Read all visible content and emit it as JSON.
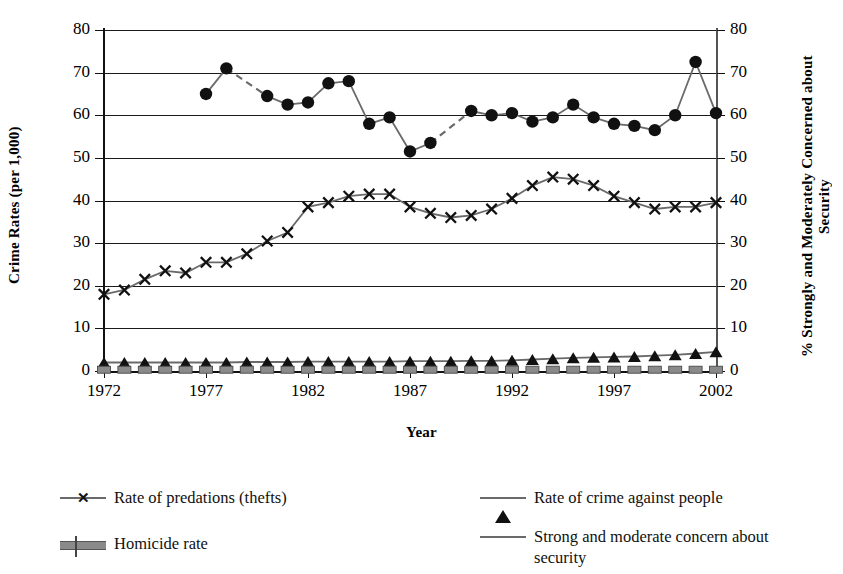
{
  "axes": {
    "y_left_title": "Crime Rates (per 1,000)",
    "y_right_title": "% Strongly and Moderately Concerned about Security",
    "x_title": "Year",
    "y_ticks": [
      0,
      10,
      20,
      30,
      40,
      50,
      60,
      70,
      80
    ],
    "x_ticks": [
      1972,
      1977,
      1982,
      1987,
      1992,
      1997,
      2002
    ]
  },
  "legend": {
    "items": [
      {
        "label": "Rate of predations (thefts)",
        "marker": "x-marker-icon",
        "color": "#6a6a6a"
      },
      {
        "label": "Rate of crime against people",
        "marker": "triangle-marker-icon",
        "color": "#6a6a6a"
      },
      {
        "label": "Homicide rate",
        "marker": "thick-bar-marker-icon",
        "color": "#8a8a8a"
      },
      {
        "label": "Strong and moderate concern about security",
        "marker": "circle-marker-icon",
        "color": "#6a6a6a"
      }
    ]
  },
  "chart_data": {
    "type": "line",
    "title": "",
    "xlabel": "Year",
    "ylabel": "Crime Rates (per 1,000)",
    "y2label": "% Strongly and Moderately Concerned about Security",
    "xlim": [
      1972,
      2002
    ],
    "ylim": [
      0,
      80
    ],
    "y2lim": [
      0,
      80
    ],
    "grid": true,
    "legend_position": "bottom",
    "x": [
      1972,
      1973,
      1974,
      1975,
      1976,
      1977,
      1978,
      1979,
      1980,
      1981,
      1982,
      1983,
      1984,
      1985,
      1986,
      1987,
      1988,
      1989,
      1990,
      1991,
      1992,
      1993,
      1994,
      1995,
      1996,
      1997,
      1998,
      1999,
      2000,
      2001,
      2002
    ],
    "series": [
      {
        "name": "Rate of predations (thefts)",
        "axis": "left",
        "marker": "x",
        "values": [
          18.0,
          19.0,
          21.5,
          23.5,
          23.0,
          25.5,
          25.5,
          27.5,
          30.5,
          32.5,
          38.5,
          39.5,
          41.0,
          41.5,
          41.5,
          38.5,
          37.0,
          36.0,
          36.5,
          38.0,
          40.5,
          43.5,
          45.5,
          45.0,
          43.5,
          41.0,
          39.5,
          38.0,
          38.5,
          38.5,
          39.5
        ]
      },
      {
        "name": "Rate of crime against people",
        "axis": "left",
        "marker": "triangle",
        "values": [
          2.0,
          2.0,
          2.0,
          2.0,
          2.0,
          2.0,
          2.0,
          2.1,
          2.1,
          2.1,
          2.2,
          2.2,
          2.2,
          2.2,
          2.2,
          2.3,
          2.3,
          2.3,
          2.4,
          2.4,
          2.5,
          2.7,
          2.9,
          3.1,
          3.2,
          3.3,
          3.4,
          3.6,
          3.8,
          4.1,
          4.5
        ]
      },
      {
        "name": "Homicide rate",
        "axis": "left",
        "marker": "bar",
        "values": [
          0.3,
          0.3,
          0.3,
          0.3,
          0.3,
          0.3,
          0.3,
          0.3,
          0.3,
          0.3,
          0.3,
          0.3,
          0.3,
          0.3,
          0.3,
          0.3,
          0.3,
          0.3,
          0.3,
          0.3,
          0.3,
          0.3,
          0.3,
          0.3,
          0.3,
          0.3,
          0.3,
          0.3,
          0.3,
          0.3,
          0.3
        ]
      },
      {
        "name": "Strong and moderate concern about security",
        "axis": "right",
        "marker": "circle",
        "values": [
          null,
          null,
          null,
          null,
          null,
          65.0,
          71.0,
          null,
          64.5,
          62.5,
          63.0,
          67.5,
          68.0,
          58.0,
          59.5,
          51.5,
          53.5,
          null,
          61.0,
          60.0,
          60.5,
          58.5,
          59.5,
          62.5,
          59.5,
          58.0,
          57.5,
          56.5,
          60.0,
          72.5,
          60.5
        ],
        "dashed_gaps": [
          [
            1978,
            1980
          ],
          [
            1989,
            1990
          ]
        ]
      }
    ]
  },
  "colors": {
    "line": "#6a6a6a",
    "marker": "#111111",
    "homicide": "#8a8a8a",
    "axis": "#111111"
  }
}
